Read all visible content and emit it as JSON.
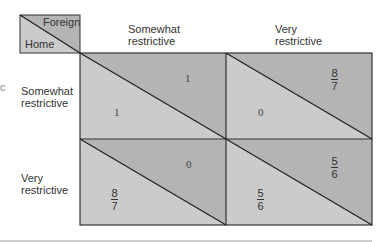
{
  "corner": {
    "foreign": "Foreign",
    "home": "Home"
  },
  "columns": [
    {
      "line1": "Somewhat",
      "line2": "restrictive"
    },
    {
      "line1": "Very",
      "line2": "restrictive"
    }
  ],
  "rows": [
    {
      "line1": "Somewhat",
      "line2": "restrictive"
    },
    {
      "line1": "Very",
      "line2": "restrictive"
    }
  ],
  "cells": [
    {
      "foreign": "1",
      "home": "1"
    },
    {
      "foreign": {
        "num": "8",
        "den": "7"
      },
      "home": "0"
    },
    {
      "foreign": "0",
      "home": {
        "num": "8",
        "den": "7"
      }
    },
    {
      "foreign": {
        "num": "5",
        "den": "6"
      },
      "home": {
        "num": "5",
        "den": "6"
      }
    }
  ],
  "colors": {
    "upper": "#b4b4b4",
    "lower": "#cbcbcb",
    "line": "#222222"
  },
  "edge_fragment": "c"
}
